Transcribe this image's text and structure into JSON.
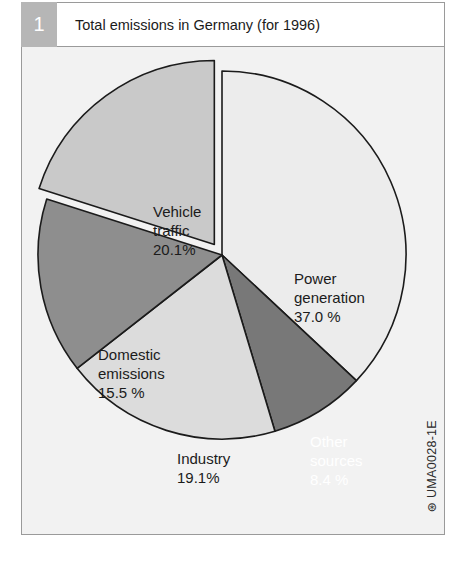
{
  "figure": {
    "number": "1",
    "title": "Total emissions in Germany (for 1996)",
    "credit": "UMA0028-1E",
    "credit_mark": "⊛"
  },
  "colors": {
    "panel_border": "#9a9a9a",
    "badge_background": "#b6b6b6",
    "chart_background": "#f2f2f2",
    "slice_outline": "#1b1b1b",
    "power_generation": "#ececec",
    "vehicle_traffic": "#c9c9c9",
    "domestic_emissions": "#8e8e8e",
    "industry": "#dcdcdc",
    "other_sources": "#787878"
  },
  "chart_data": {
    "type": "pie",
    "title": "Total emissions in Germany (for 1996)",
    "xlabel": "",
    "ylabel": "",
    "units": "percent",
    "total": 100.1,
    "start_angle_deg": 0,
    "direction": "clockwise",
    "exploded_slices": [
      "Vehicle traffic"
    ],
    "legend": "none (labels placed on slices)",
    "grid": false,
    "categories": [
      "Power generation",
      "Other sources",
      "Industry",
      "Domestic emissions",
      "Vehicle traffic"
    ],
    "values": [
      37.0,
      8.4,
      19.1,
      15.5,
      20.1
    ],
    "slices": [
      {
        "name": "Power generation",
        "value": 37.0,
        "label_name": "Power",
        "label_name2": "generation",
        "label_value": "37.0 %",
        "color": "#ececec",
        "text_color": "dark",
        "exploded": false
      },
      {
        "name": "Other sources",
        "value": 8.4,
        "label_name": "Other",
        "label_name2": "sources",
        "label_value": "8.4 %",
        "color": "#787878",
        "text_color": "light",
        "exploded": false
      },
      {
        "name": "Industry",
        "value": 19.1,
        "label_name": "Industry",
        "label_name2": "",
        "label_value": "19.1%",
        "color": "#dcdcdc",
        "text_color": "dark",
        "exploded": false
      },
      {
        "name": "Domestic emissions",
        "value": 15.5,
        "label_name": "Domestic",
        "label_name2": "emissions",
        "label_value": "15.5 %",
        "color": "#8e8e8e",
        "text_color": "dark",
        "exploded": false
      },
      {
        "name": "Vehicle traffic",
        "value": 20.1,
        "label_name": "Vehicle",
        "label_name2": "traffic",
        "label_value": "20.1%",
        "color": "#c9c9c9",
        "text_color": "dark",
        "exploded": true
      }
    ]
  }
}
